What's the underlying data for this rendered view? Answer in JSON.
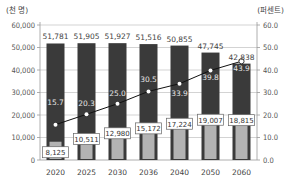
{
  "chart_data": {
    "type": "bar",
    "title": "",
    "left_axis_unit": "(천 명)",
    "right_axis_unit": "(퍼센트)",
    "categories": [
      "2020",
      "2025",
      "2030",
      "2036",
      "2040",
      "2050",
      "2060"
    ],
    "left_ticks": [
      "0",
      "10,000",
      "20,000",
      "30,000",
      "40,000",
      "50,000",
      "60,000"
    ],
    "right_ticks": [
      "0.0",
      "10.0",
      "20.0",
      "30.0",
      "40.0",
      "50.0",
      "60.0"
    ],
    "ylim_left": [
      0,
      60000
    ],
    "ylim_right": [
      0,
      60
    ],
    "grid": true,
    "series": [
      {
        "name": "total_population",
        "kind": "bar",
        "color": "#3a3a3a",
        "axis": "left",
        "values": [
          51781,
          51905,
          51927,
          51516,
          50855,
          47745,
          42838
        ],
        "labels": [
          "51,781",
          "51,905",
          "51,927",
          "51,516",
          "50,855",
          "47,745",
          "42,838"
        ]
      },
      {
        "name": "elderly_population",
        "kind": "bar",
        "color": "#b3b3b3",
        "axis": "left",
        "values": [
          8125,
          10511,
          12980,
          15172,
          17224,
          19007,
          18815
        ],
        "labels": [
          "8,125",
          "10,511",
          "12,980",
          "15,172",
          "17,224",
          "19,007",
          "18,815"
        ]
      },
      {
        "name": "elderly_ratio",
        "kind": "line",
        "color": "#111111",
        "axis": "right",
        "values": [
          15.7,
          20.3,
          25.0,
          30.5,
          33.9,
          39.8,
          43.9
        ],
        "labels": [
          "15.7",
          "20.3",
          "25.0",
          "30.5",
          "33.9",
          "39.8",
          "43.9"
        ]
      }
    ]
  }
}
